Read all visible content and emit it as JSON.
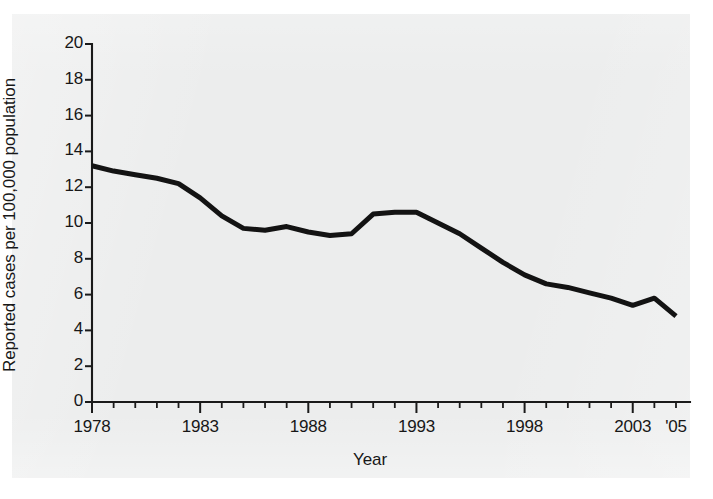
{
  "figure": {
    "background_color": "#ffffff",
    "panel_color": "#eceded",
    "line_color": "#131313",
    "axis_color": "#1a1a1a"
  },
  "axis": {
    "x_label": "Year",
    "y_label": "Reported cases per 100,000 population",
    "y_ticks": [
      "0",
      "2",
      "4",
      "6",
      "8",
      "10",
      "12",
      "14",
      "16",
      "18",
      "20"
    ],
    "x_tick_labels": [
      "1978",
      "1983",
      "1988",
      "1993",
      "1998",
      "2003",
      "'05"
    ]
  },
  "chart_data": {
    "type": "line",
    "title": "",
    "xlabel": "Year",
    "ylabel": "Reported cases per 100,000 population",
    "xlim": [
      1978,
      2005
    ],
    "ylim": [
      0,
      20
    ],
    "ytick_values": [
      0,
      2,
      4,
      6,
      8,
      10,
      12,
      14,
      16,
      18,
      20
    ],
    "xtick_values": [
      1978,
      1983,
      1988,
      1993,
      1998,
      2003,
      2005
    ],
    "xtick_labels": [
      "1978",
      "1983",
      "1988",
      "1993",
      "1998",
      "2003",
      "'05"
    ],
    "x_minor_tick_step": 1,
    "grid": false,
    "legend": false,
    "series": [
      {
        "name": "Reported cases per 100,000 population",
        "color": "#131313",
        "x": [
          1978,
          1979,
          1980,
          1981,
          1982,
          1983,
          1984,
          1985,
          1986,
          1987,
          1988,
          1989,
          1990,
          1991,
          1992,
          1993,
          1994,
          1995,
          1996,
          1997,
          1998,
          1999,
          2000,
          2001,
          2002,
          2003,
          2004,
          2005
        ],
        "values": [
          13.2,
          12.9,
          12.7,
          12.5,
          12.2,
          11.4,
          10.4,
          9.7,
          9.6,
          9.8,
          9.5,
          9.3,
          9.4,
          10.5,
          10.6,
          10.6,
          10.0,
          9.4,
          8.6,
          7.8,
          7.1,
          6.6,
          6.4,
          6.1,
          5.8,
          5.4,
          5.8,
          4.8
        ]
      }
    ]
  }
}
